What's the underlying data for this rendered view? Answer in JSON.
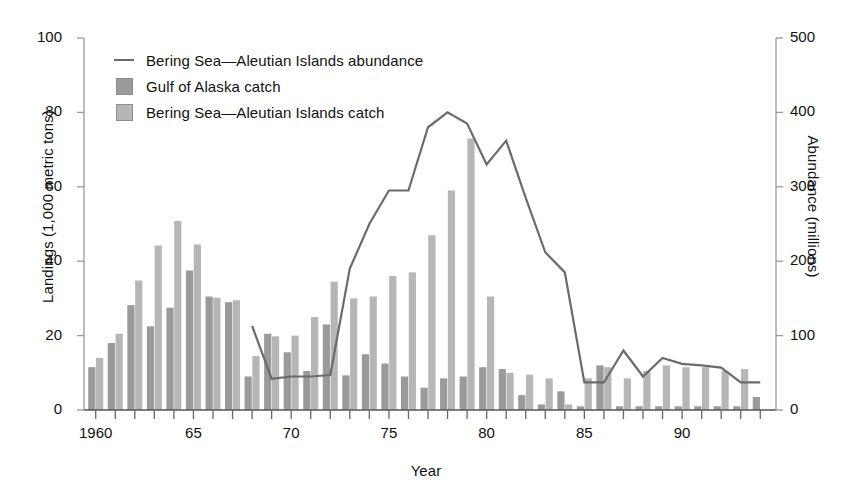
{
  "chart_data": {
    "type": "bar",
    "title": "",
    "xlabel": "Year",
    "ylabel": "Landings (1,000 metric tons)",
    "y2label": "Abundance (millions)",
    "ylim": [
      0,
      100
    ],
    "y2lim": [
      0,
      500
    ],
    "xlim": [
      1959.4,
      1994.6
    ],
    "grid": false,
    "legend_position": "top-left",
    "y_ticks": [
      "0",
      "20",
      "40",
      "60",
      "80",
      "100"
    ],
    "y_tick_values": [
      0,
      20,
      40,
      60,
      80,
      100
    ],
    "y2_ticks": [
      "0",
      "100",
      "200",
      "300",
      "400",
      "500"
    ],
    "y2_tick_values": [
      0,
      100,
      200,
      300,
      400,
      500
    ],
    "x_tick_labels": [
      "1960",
      "65",
      "70",
      "75",
      "80",
      "85",
      "90"
    ],
    "x_tick_label_values": [
      1960,
      1965,
      1970,
      1975,
      1980,
      1985,
      1990
    ],
    "categories": [
      1960,
      1961,
      1962,
      1963,
      1964,
      1965,
      1966,
      1967,
      1968,
      1969,
      1970,
      1971,
      1972,
      1973,
      1974,
      1975,
      1976,
      1977,
      1978,
      1979,
      1980,
      1981,
      1982,
      1983,
      1984,
      1985,
      1986,
      1987,
      1988,
      1989,
      1990,
      1991,
      1992,
      1993,
      1994
    ],
    "series": [
      {
        "name": "Gulf of Alaska catch",
        "type": "bar",
        "color": "#9a9a9a",
        "axis": "left",
        "values": [
          11.5,
          18.0,
          28.2,
          22.5,
          27.5,
          37.5,
          30.5,
          29.0,
          9.0,
          20.5,
          15.5,
          10.5,
          23.0,
          9.3,
          15.0,
          12.5,
          9.0,
          6.0,
          8.5,
          9.0,
          11.5,
          11.0,
          4.0,
          1.5,
          5.0,
          1.0,
          12.0,
          1.0,
          1.0,
          1.0,
          1.0,
          1.0,
          1.0,
          1.0,
          3.5
        ]
      },
      {
        "name": "Bering Sea—Aleutian Islands catch",
        "type": "bar",
        "color": "#b6b6b6",
        "axis": "left",
        "values": [
          14.0,
          20.5,
          34.8,
          44.2,
          50.8,
          44.5,
          30.2,
          29.5,
          14.5,
          19.8,
          20.0,
          25.0,
          34.5,
          30.0,
          30.5,
          36.0,
          37.0,
          47.0,
          59.0,
          73.0,
          30.5,
          10.0,
          9.5,
          8.5,
          1.5,
          8.5,
          11.5,
          8.5,
          10.5,
          12.0,
          11.5,
          11.5,
          10.5,
          11.0,
          0.0
        ]
      },
      {
        "name": "Bering Sea—Aleutian Islands abundance",
        "type": "line",
        "color": "#6b6b6b",
        "axis": "right",
        "x": [
          1968,
          1969,
          1970,
          1971,
          1972,
          1973,
          1974,
          1975,
          1976,
          1977,
          1978,
          1979,
          1980,
          1981,
          1982,
          1983,
          1984,
          1985,
          1986,
          1987,
          1988,
          1989,
          1990,
          1991,
          1992,
          1993,
          1994
        ],
        "values": [
          113,
          42,
          45,
          45,
          47,
          190,
          250,
          295,
          295,
          380,
          400,
          385,
          330,
          362,
          285,
          212,
          185,
          37,
          37,
          80,
          45,
          70,
          62,
          60,
          57,
          37,
          37
        ]
      }
    ]
  },
  "legend": {
    "items": [
      {
        "label": "Bering Sea—Aleutian Islands abundance",
        "mark": "line",
        "color": "#6b6b6b"
      },
      {
        "label": "Gulf of Alaska catch",
        "mark": "swatch",
        "color": "#9a9a9a"
      },
      {
        "label": "Bering Sea—Aleutian Islands catch",
        "mark": "swatch",
        "color": "#b6b6b6"
      }
    ]
  }
}
